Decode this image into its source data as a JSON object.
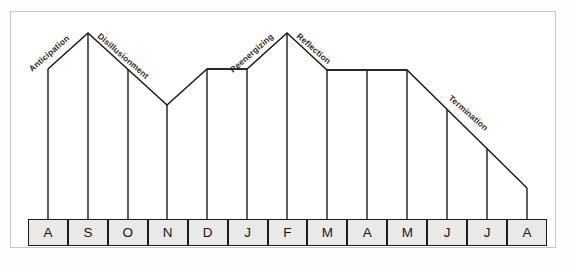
{
  "figure": {
    "name": "cross-cultural-adjustment-curve",
    "frame_color": "#c9c9c4",
    "line_color": "#1b1b1b",
    "cell_fill": "#e9e9e7",
    "cell_border": "#1b1b1b",
    "background": "#fffffe"
  },
  "axis": {
    "month_labels": [
      "A",
      "S",
      "O",
      "N",
      "D",
      "J",
      "F",
      "M",
      "A",
      "M",
      "J",
      "J",
      "A"
    ]
  },
  "phases": [
    {
      "label": "Anticipation",
      "rotation": -41
    },
    {
      "label": "Disillusionment",
      "rotation": 41
    },
    {
      "label": "Reenergizing",
      "rotation": -41
    },
    {
      "label": "Reflection",
      "rotation": 41
    },
    {
      "label": "Termination",
      "rotation": 41
    }
  ],
  "chart_data": {
    "type": "line",
    "title": "",
    "subtitle": "",
    "xlabel": "",
    "ylabel": "",
    "grid": false,
    "legend": "none",
    "note": "Stage/morale curve over a 13-month sojourn; y is a qualitative adjustment level (0 = lowest drawn, 100 = peak). Vertical drop lines connect each month marker down to its month box.",
    "categories": [
      "A",
      "S",
      "O",
      "N",
      "D",
      "J",
      "F",
      "M",
      "A",
      "M",
      "J",
      "J",
      "A"
    ],
    "x": [
      0,
      1,
      2,
      3,
      4,
      5,
      6,
      7,
      8,
      9,
      10,
      11,
      12
    ],
    "values": [
      77,
      100,
      77,
      54,
      77,
      77,
      100,
      76,
      76,
      76,
      52,
      28,
      3
    ],
    "ylim": [
      0,
      100
    ],
    "series": [
      {
        "name": "Adjustment level",
        "values": [
          77,
          100,
          77,
          54,
          77,
          77,
          100,
          76,
          76,
          76,
          52,
          28,
          3
        ]
      }
    ],
    "annotations": [
      {
        "text": "Anticipation",
        "between": [
          "A",
          "S"
        ]
      },
      {
        "text": "Disillusionment",
        "between": [
          "S",
          "N"
        ]
      },
      {
        "text": "Reenergizing",
        "between": [
          "D",
          "F"
        ]
      },
      {
        "text": "Reflection",
        "between": [
          "F",
          "M"
        ]
      },
      {
        "text": "Termination",
        "between": [
          "M",
          "A"
        ]
      }
    ]
  }
}
